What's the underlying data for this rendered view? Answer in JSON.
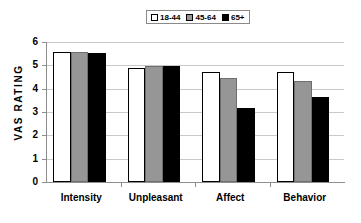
{
  "chart_data": {
    "type": "bar",
    "title": "",
    "xlabel": "",
    "ylabel": "VAS RATING",
    "ylim": [
      0,
      6
    ],
    "yticks": [
      "0",
      "1",
      "2",
      "3",
      "4",
      "5",
      "6"
    ],
    "grid": true,
    "legend_position": "top-center",
    "categories": [
      "Intensity",
      "Unpleasant",
      "Affect",
      "Behavior"
    ],
    "series": [
      {
        "name": "18-44",
        "color": "#ffffff",
        "values": [
          5.58,
          4.9,
          4.73,
          4.73
        ]
      },
      {
        "name": "45-64",
        "color": "#969696",
        "values": [
          5.58,
          4.96,
          4.47,
          4.35
        ]
      },
      {
        "name": "65+",
        "color": "#000000",
        "values": [
          5.52,
          4.98,
          3.18,
          3.65
        ]
      }
    ]
  },
  "legend": {
    "items": [
      {
        "label": "18-44",
        "swatch": "white"
      },
      {
        "label": "45-64",
        "swatch": "gray"
      },
      {
        "label": "65+",
        "swatch": "black"
      }
    ]
  },
  "axes": {
    "y_title": "VAS RATING",
    "y_ticks": [
      "6",
      "5",
      "4",
      "3",
      "2",
      "1",
      "0"
    ],
    "x_categories": [
      "Intensity",
      "Unpleasant",
      "Affect",
      "Behavior"
    ]
  },
  "colors": {
    "series_white": "#ffffff",
    "series_gray": "#969696",
    "series_black": "#000000",
    "gridline": "#c9c9c9",
    "axis": "#8f8f8f",
    "text": "#000000",
    "background": "#ffffff"
  }
}
